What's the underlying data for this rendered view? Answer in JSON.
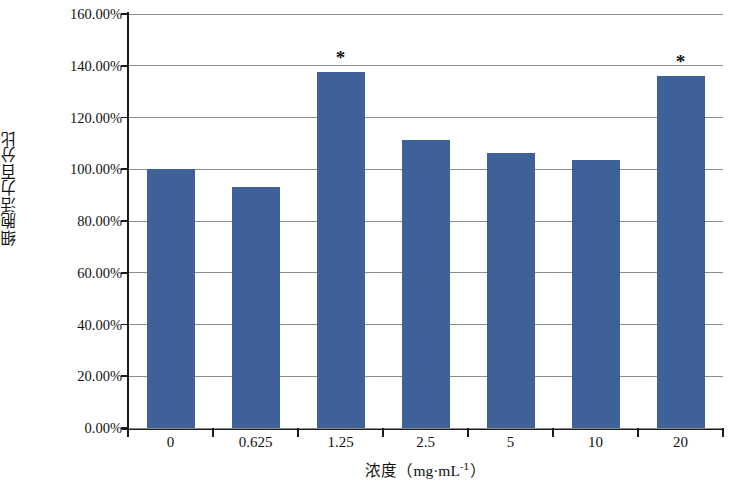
{
  "chart_data": {
    "type": "bar",
    "title": "",
    "subtitle": "",
    "xlabel": "浓度（mg·mL⁻¹）",
    "xlabel_parts": {
      "name": "浓度",
      "open_paren": "（",
      "unit_main": "mg·mL",
      "unit_exp": "-1",
      "close_paren": "）"
    },
    "ylabel": "细胞活力百分比",
    "categories": [
      "0",
      "0.625",
      "1.25",
      "2.5",
      "5",
      "10",
      "20"
    ],
    "values": [
      100.0,
      93.0,
      137.7,
      111.2,
      106.2,
      103.5,
      136.1
    ],
    "value_labels": [
      "100.00%",
      "93.00%",
      "137.70%",
      "111.20%",
      "106.20%",
      "103.50%",
      "136.10%"
    ],
    "annotations": [
      {
        "category": "1.25",
        "text": "*"
      },
      {
        "category": "20",
        "text": "*"
      }
    ],
    "ylim": [
      0,
      160
    ],
    "ytick_values": [
      160,
      140,
      120,
      100,
      80,
      60,
      40,
      20,
      0
    ],
    "ytick_labels": [
      "160.00%",
      "140.00%",
      "120.00%",
      "100.00%",
      "80.00%",
      "60.00%",
      "40.00%",
      "20.00%",
      "0.00%"
    ],
    "grid": true,
    "grid_axis": "y",
    "legend": null,
    "legend_position": "none",
    "bar_color": "#3e6198",
    "grid_color": "#8c8c8c",
    "axis_color": "#1b1b1b",
    "background_color": "#ffffff"
  }
}
